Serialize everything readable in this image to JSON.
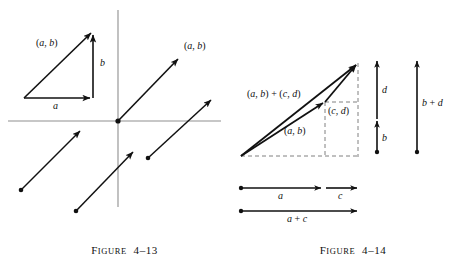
{
  "document": {
    "kind": "textbook-vector-figures",
    "background_color": "#ffffff",
    "ink_color": "#111111",
    "axis_color": "#8a8a8a",
    "dashed_color": "#777777"
  },
  "figure_left": {
    "caption_prefix": "F",
    "caption_word": "IGURE",
    "caption_number": "4–13",
    "caption_full": "Figure 4–13",
    "labels": {
      "hypotenuse_vector": "(a, b)",
      "vertical_leg": "b",
      "horizontal_leg": "a",
      "origin_vector": "(a, b)"
    },
    "axes": {
      "x_axis": "horizontal-axis",
      "y_axis": "vertical-axis",
      "origin_dot": "origin-point"
    },
    "vectors": [
      {
        "name": "triangle-hypotenuse-vector",
        "label": "(a, b)"
      },
      {
        "name": "triangle-vertical-vector",
        "label": "b"
      },
      {
        "name": "triangle-horizontal-vector",
        "label": "a"
      },
      {
        "name": "origin-vector",
        "label": "(a, b)"
      },
      {
        "name": "translated-vector-lower-left",
        "label": ""
      },
      {
        "name": "translated-vector-lower-middle",
        "label": ""
      },
      {
        "name": "translated-vector-lower-right",
        "label": ""
      }
    ]
  },
  "figure_right": {
    "caption_prefix": "F",
    "caption_word": "IGURE",
    "caption_number": "4–14",
    "caption_full": "Figure 4–14",
    "labels": {
      "sum_vector": "(a, b) + (c, d)",
      "first_vector": "(a, b)",
      "second_vector": "(c, d)",
      "vertical_b": "b",
      "vertical_d": "d",
      "vertical_sum": "b + d",
      "horizontal_a": "a",
      "horizontal_c": "c",
      "horizontal_sum": "a + c"
    },
    "vectors": [
      {
        "name": "sum-vector",
        "label": "(a, b) + (c, d)"
      },
      {
        "name": "vector-ab",
        "label": "(a, b)"
      },
      {
        "name": "vector-cd",
        "label": "(c, d)"
      },
      {
        "name": "segment-b",
        "label": "b"
      },
      {
        "name": "segment-d",
        "label": "d"
      },
      {
        "name": "segment-b-plus-d",
        "label": "b + d"
      },
      {
        "name": "segment-a",
        "label": "a"
      },
      {
        "name": "segment-c",
        "label": "c"
      },
      {
        "name": "segment-a-plus-c",
        "label": "a + c"
      }
    ],
    "dashed_guides": [
      "dashed-baseline",
      "dashed-vertical-right",
      "dashed-vertical-middle",
      "dashed-horizontal-middle"
    ]
  }
}
